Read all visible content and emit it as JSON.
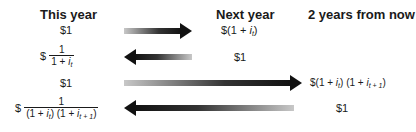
{
  "headers": {
    "this_year": "This year",
    "next_year": "Next year",
    "two_years": "2 years from now"
  },
  "rows": [
    {
      "this_year": "$1",
      "direction": "right",
      "next_year": {
        "prefix": "$(1 + ",
        "var": "i",
        "sub": "t",
        "suffix": ")"
      }
    },
    {
      "this_year": {
        "prefix": "$",
        "numerator": "1",
        "denominator_prefix": "1 + ",
        "var": "i",
        "sub": "t"
      },
      "direction": "left",
      "next_year": "$1"
    },
    {
      "this_year": "$1",
      "direction": "right",
      "two_years": {
        "prefix": "$(1 + ",
        "var1": "i",
        "sub1": "t",
        "mid": ") (1 + ",
        "var2": "i",
        "sub2": "t + 1",
        "suffix": ")"
      }
    },
    {
      "this_year": {
        "prefix": "$",
        "numerator": "1",
        "den_a": "(1 + ",
        "var1": "i",
        "sub1": "t",
        "den_b": ") (1 + ",
        "var2": "i",
        "sub2": "t + 1",
        "den_c": ")"
      },
      "direction": "left",
      "two_years": "$1"
    }
  ]
}
